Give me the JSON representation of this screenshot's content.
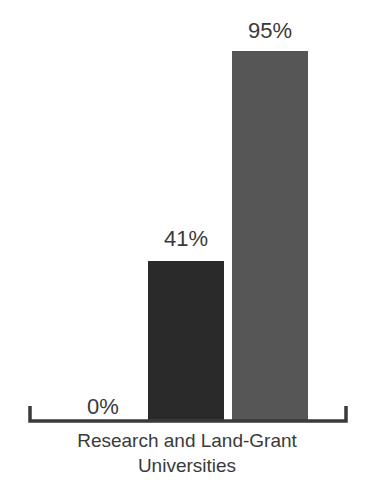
{
  "chart_data": {
    "type": "bar",
    "title": "",
    "subtitle": "",
    "xlabel": "Research and Land-Grant Universities",
    "ylabel": "",
    "ylim": [
      0,
      100
    ],
    "grid": false,
    "legend": null,
    "categories": [
      "Research and Land-Grant Universities"
    ],
    "series": [
      {
        "name": "bar-1",
        "values": [
          0
        ],
        "label": "0%",
        "color": "#ffffff"
      },
      {
        "name": "bar-2",
        "values": [
          41
        ],
        "label": "41%",
        "color": "#2a2a2a"
      },
      {
        "name": "bar-3",
        "values": [
          95
        ],
        "label": "95%",
        "color": "#565656"
      }
    ],
    "bars": [
      {
        "id": "bar-zero",
        "value": 0,
        "label": "0%",
        "color": "#ffffff"
      },
      {
        "id": "bar-forty-one",
        "value": 41,
        "label": "41%",
        "color": "#2a2a2a"
      },
      {
        "id": "bar-ninety-five",
        "value": 95,
        "label": "95%",
        "color": "#565656"
      }
    ],
    "annotations": [
      "0%",
      "41%",
      "95%"
    ]
  },
  "labels": {
    "zero": "0%",
    "forty_one": "41%",
    "ninety_five": "95%"
  },
  "caption": {
    "line1": "Research and Land-Grant",
    "line2": "Universities"
  },
  "colors": {
    "background": "#ffffff",
    "bar_dark": "#2a2a2a",
    "bar_gray": "#565656",
    "text": "#3a3a3a",
    "axis": "#3a3a3a"
  }
}
